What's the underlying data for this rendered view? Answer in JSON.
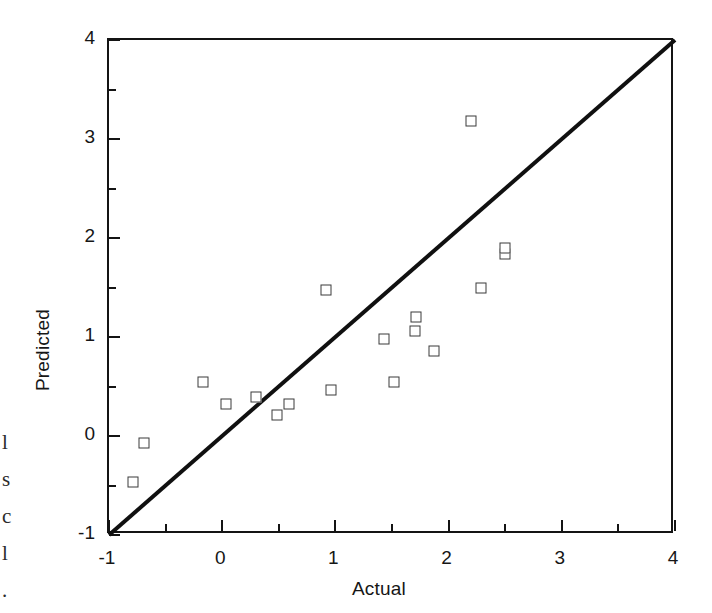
{
  "figure": {
    "background_color": "#ffffff",
    "foreground_color": "#141414",
    "marker_color": "#3a3a3a",
    "reference_line_color": "#101010"
  },
  "margin_text": "l\ns\nc\nl\n.",
  "chart_data": {
    "type": "scatter",
    "title": "",
    "subtitle": "",
    "xlabel": "Actual",
    "ylabel": "Predicted",
    "xlim": [
      -1,
      4
    ],
    "ylim": [
      -1,
      4
    ],
    "xticks": [
      -1,
      0,
      1,
      2,
      3,
      4
    ],
    "yticks": [
      -1,
      0,
      1,
      2,
      3,
      4
    ],
    "xticklabels": [
      "-1",
      "0",
      "1",
      "2",
      "3",
      "4"
    ],
    "yticklabels": [
      "-1",
      "0",
      "1",
      "2",
      "3",
      "4"
    ],
    "minor_tick_step": 0.5,
    "grid": false,
    "legend": null,
    "marker_style": "open-square",
    "annotations": [],
    "reference_line": {
      "label": "y = x",
      "from": [
        -1,
        -1
      ],
      "to": [
        4,
        4
      ]
    },
    "series": [
      {
        "name": "Predicted vs Actual",
        "x": [
          -0.79,
          -0.69,
          -0.17,
          0.03,
          0.3,
          0.48,
          0.59,
          0.92,
          0.96,
          1.43,
          1.52,
          1.7,
          1.71,
          1.87,
          2.2,
          2.29,
          2.5,
          2.5
        ],
        "y": [
          -0.46,
          -0.07,
          0.55,
          0.32,
          0.39,
          0.21,
          0.32,
          1.47,
          0.46,
          0.98,
          0.55,
          1.06,
          1.2,
          0.86,
          3.18,
          1.49,
          1.84,
          1.9
        ],
        "points": [
          {
            "actual": -0.79,
            "predicted": -0.46
          },
          {
            "actual": -0.69,
            "predicted": -0.07
          },
          {
            "actual": -0.17,
            "predicted": 0.55
          },
          {
            "actual": 0.03,
            "predicted": 0.32
          },
          {
            "actual": 0.3,
            "predicted": 0.39
          },
          {
            "actual": 0.48,
            "predicted": 0.21
          },
          {
            "actual": 0.59,
            "predicted": 0.32
          },
          {
            "actual": 0.92,
            "predicted": 1.47
          },
          {
            "actual": 0.96,
            "predicted": 0.46
          },
          {
            "actual": 1.43,
            "predicted": 0.98
          },
          {
            "actual": 1.52,
            "predicted": 0.55
          },
          {
            "actual": 1.7,
            "predicted": 1.06
          },
          {
            "actual": 1.71,
            "predicted": 1.2
          },
          {
            "actual": 1.87,
            "predicted": 0.86
          },
          {
            "actual": 2.2,
            "predicted": 3.18
          },
          {
            "actual": 2.29,
            "predicted": 1.49
          },
          {
            "actual": 2.5,
            "predicted": 1.84
          },
          {
            "actual": 2.5,
            "predicted": 1.9
          }
        ]
      }
    ]
  }
}
